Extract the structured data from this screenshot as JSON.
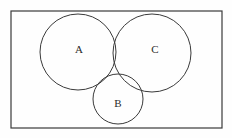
{
  "figure": {
    "background_color": "#fefefe",
    "stroke_color": "#3a3a3a",
    "label_color": "#2b2b2b",
    "universe_rect": {
      "x": 11,
      "y": 11,
      "width": 211,
      "height": 117,
      "stroke_width": 1.2
    },
    "circles": [
      {
        "id": "A",
        "label": "A",
        "cx": 78,
        "cy": 52,
        "r": 38,
        "label_x": 79,
        "label_y": 50
      },
      {
        "id": "C",
        "label": "C",
        "cx": 152,
        "cy": 53,
        "r": 39,
        "label_x": 155,
        "label_y": 50
      },
      {
        "id": "B",
        "label": "B",
        "cx": 118,
        "cy": 99,
        "r": 25,
        "label_x": 118,
        "label_y": 104
      }
    ]
  }
}
